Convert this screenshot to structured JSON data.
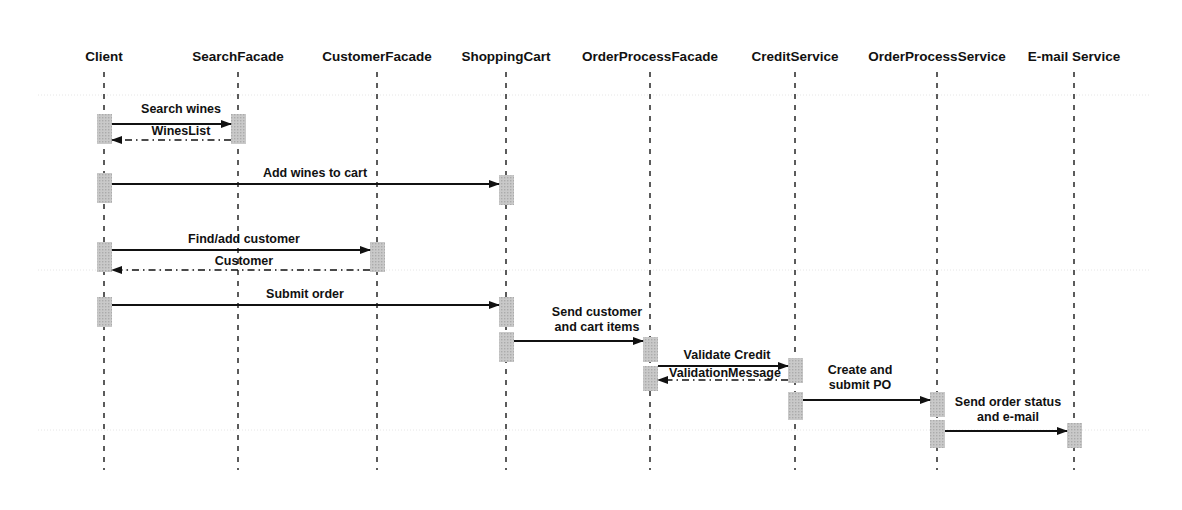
{
  "diagram": {
    "type": "uml-sequence-diagram",
    "title": "",
    "canvas": {
      "width": 1182,
      "height": 510
    },
    "colors": {
      "line": "#111111",
      "text": "#111111",
      "activation_fill": "#c9c9c9",
      "lifeline_dash": "#333333",
      "grid": "#e6e6e6",
      "background": "#ffffff"
    },
    "participants": [
      {
        "id": "client",
        "label": "Client",
        "x": 104,
        "label_y": 61
      },
      {
        "id": "search-facade",
        "label": "SearchFacade",
        "x": 238,
        "label_y": 61
      },
      {
        "id": "customer-facade",
        "label": "CustomerFacade",
        "x": 377,
        "label_y": 61
      },
      {
        "id": "shopping-cart",
        "label": "ShoppingCart",
        "x": 506,
        "label_y": 61
      },
      {
        "id": "order-process-facade",
        "label": "OrderProcessFacade",
        "x": 650,
        "label_y": 61
      },
      {
        "id": "credit-service",
        "label": "CreditService",
        "x": 795,
        "label_y": 61
      },
      {
        "id": "order-process-service",
        "label": "OrderProcessService",
        "x": 937,
        "label_y": 61
      },
      {
        "id": "email-service",
        "label": "E-mail Service",
        "x": 1074,
        "label_y": 61
      }
    ],
    "lifelines": {
      "top": 72,
      "bottom": 470
    },
    "grid_lines_y": [
      95,
      270,
      430
    ],
    "activations": [
      {
        "id": "act-client-1",
        "participant": "client",
        "x": 97,
        "y": 114,
        "w": 15,
        "h": 30
      },
      {
        "id": "act-search-1",
        "participant": "search-facade",
        "x": 231,
        "y": 114,
        "w": 15,
        "h": 30
      },
      {
        "id": "act-client-2",
        "participant": "client",
        "x": 97,
        "y": 173,
        "w": 15,
        "h": 30
      },
      {
        "id": "act-cart-1",
        "participant": "shopping-cart",
        "x": 499,
        "y": 175,
        "w": 15,
        "h": 30
      },
      {
        "id": "act-client-3",
        "participant": "client",
        "x": 97,
        "y": 242,
        "w": 15,
        "h": 30
      },
      {
        "id": "act-customer-1",
        "participant": "customer-facade",
        "x": 370,
        "y": 242,
        "w": 15,
        "h": 30
      },
      {
        "id": "act-client-4",
        "participant": "client",
        "x": 97,
        "y": 297,
        "w": 15,
        "h": 30
      },
      {
        "id": "act-cart-2",
        "participant": "shopping-cart",
        "x": 499,
        "y": 297,
        "w": 15,
        "h": 30
      },
      {
        "id": "act-cart-3",
        "participant": "shopping-cart",
        "x": 499,
        "y": 332,
        "w": 15,
        "h": 30
      },
      {
        "id": "act-opf-1",
        "participant": "order-process-facade",
        "x": 643,
        "y": 337,
        "w": 15,
        "h": 25
      },
      {
        "id": "act-opf-2",
        "participant": "order-process-facade",
        "x": 643,
        "y": 366,
        "w": 15,
        "h": 25
      },
      {
        "id": "act-credit-1",
        "participant": "credit-service",
        "x": 788,
        "y": 358,
        "w": 15,
        "h": 25
      },
      {
        "id": "act-credit-2",
        "participant": "credit-service",
        "x": 788,
        "y": 392,
        "w": 15,
        "h": 28
      },
      {
        "id": "act-ops-1",
        "participant": "order-process-service",
        "x": 930,
        "y": 392,
        "w": 15,
        "h": 25
      },
      {
        "id": "act-ops-2",
        "participant": "order-process-service",
        "x": 930,
        "y": 420,
        "w": 15,
        "h": 28
      },
      {
        "id": "act-email-1",
        "participant": "email-service",
        "x": 1067,
        "y": 423,
        "w": 15,
        "h": 25
      }
    ],
    "messages": [
      {
        "id": "msg-search-wines",
        "label": "Search wines",
        "from": "client",
        "to": "search-facade",
        "kind": "call",
        "style": "solid",
        "direction": "right",
        "x1": 112,
        "x2": 231,
        "y": 124,
        "label_x": 181,
        "label_y": 113
      },
      {
        "id": "msg-wines-list",
        "label": "WinesList",
        "from": "search-facade",
        "to": "client",
        "kind": "return",
        "style": "dashed",
        "direction": "left",
        "x1": 231,
        "x2": 112,
        "y": 140,
        "label_x": 181,
        "label_y": 135
      },
      {
        "id": "msg-add-wines-to-cart",
        "label": "Add wines to cart",
        "from": "client",
        "to": "shopping-cart",
        "kind": "call",
        "style": "solid",
        "direction": "right",
        "x1": 112,
        "x2": 499,
        "y": 184,
        "label_x": 315,
        "label_y": 177
      },
      {
        "id": "msg-find-add-customer",
        "label": "Find/add customer",
        "from": "client",
        "to": "customer-facade",
        "kind": "call",
        "style": "solid",
        "direction": "right",
        "x1": 112,
        "x2": 370,
        "y": 250,
        "label_x": 244,
        "label_y": 243
      },
      {
        "id": "msg-customer",
        "label": "Customer",
        "from": "customer-facade",
        "to": "client",
        "kind": "return",
        "style": "dashed",
        "direction": "left",
        "x1": 370,
        "x2": 112,
        "y": 270,
        "label_x": 244,
        "label_y": 265
      },
      {
        "id": "msg-submit-order",
        "label": "Submit order",
        "from": "client",
        "to": "shopping-cart",
        "kind": "call",
        "style": "solid",
        "direction": "right",
        "x1": 112,
        "x2": 499,
        "y": 305,
        "label_x": 305,
        "label_y": 298
      },
      {
        "id": "msg-send-customer-and-cart-items",
        "label": "Send customer and cart items",
        "label_lines": [
          "Send customer",
          "and cart items"
        ],
        "from": "shopping-cart",
        "to": "order-process-facade",
        "kind": "call",
        "style": "solid",
        "direction": "right",
        "x1": 514,
        "x2": 643,
        "y": 341,
        "label_x": 597,
        "label_y": 316
      },
      {
        "id": "msg-validate-credit",
        "label": "Validate Credit",
        "from": "order-process-facade",
        "to": "credit-service",
        "kind": "call",
        "style": "solid",
        "direction": "right",
        "x1": 658,
        "x2": 788,
        "y": 366,
        "label_x": 727,
        "label_y": 359
      },
      {
        "id": "msg-validation-message",
        "label": "ValidationMessage",
        "from": "credit-service",
        "to": "order-process-facade",
        "kind": "return",
        "style": "dashed",
        "direction": "left",
        "x1": 788,
        "x2": 658,
        "y": 380,
        "label_x": 725,
        "label_y": 377
      },
      {
        "id": "msg-create-and-submit-po",
        "label": "Create and submit PO",
        "label_lines": [
          "Create and",
          "submit PO"
        ],
        "from": "credit-service",
        "to": "order-process-service",
        "kind": "call",
        "style": "solid",
        "direction": "right",
        "x1": 803,
        "x2": 930,
        "y": 400,
        "label_x": 860,
        "label_y": 374
      },
      {
        "id": "msg-send-order-status-and-email",
        "label": "Send order status and e-mail",
        "label_lines": [
          "Send order status",
          "and e-mail"
        ],
        "from": "order-process-service",
        "to": "email-service",
        "kind": "call",
        "style": "solid",
        "direction": "right",
        "x1": 945,
        "x2": 1067,
        "y": 431,
        "label_x": 1008,
        "label_y": 406
      }
    ]
  }
}
